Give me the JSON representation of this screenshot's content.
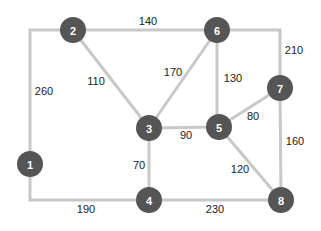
{
  "diagram": {
    "type": "weighted-graph",
    "colors": {
      "node_fill": "#555555",
      "node_text": "#ffffff",
      "edge": "#c8c8c8",
      "weight_text": "#222222"
    },
    "nodes": [
      {
        "id": "1",
        "label": "1",
        "x": 30,
        "y": 164
      },
      {
        "id": "2",
        "label": "2",
        "x": 73,
        "y": 30
      },
      {
        "id": "3",
        "label": "3",
        "x": 149,
        "y": 128
      },
      {
        "id": "4",
        "label": "4",
        "x": 149,
        "y": 200
      },
      {
        "id": "5",
        "label": "5",
        "x": 219,
        "y": 127
      },
      {
        "id": "6",
        "label": "6",
        "x": 217,
        "y": 30
      },
      {
        "id": "7",
        "label": "7",
        "x": 280,
        "y": 88
      },
      {
        "id": "8",
        "label": "8",
        "x": 281,
        "y": 200
      }
    ],
    "edges": [
      {
        "from": "2",
        "to": "1",
        "weight": "260",
        "path": "M73,30 L30,30 L30,164",
        "lx": 44,
        "ly": 91
      },
      {
        "from": "2",
        "to": "6",
        "weight": "140",
        "path": "M73,30 L217,30",
        "lx": 148,
        "ly": 21
      },
      {
        "from": "2",
        "to": "3",
        "weight": "110",
        "path": "M73,30 L149,128",
        "lx": 96,
        "ly": 81
      },
      {
        "from": "6",
        "to": "3",
        "weight": "170",
        "path": "M217,30 L149,128",
        "lx": 173,
        "ly": 72
      },
      {
        "from": "6",
        "to": "5",
        "weight": "130",
        "path": "M217,30 L217,127",
        "lx": 233,
        "ly": 78
      },
      {
        "from": "6",
        "to": "7",
        "weight": "210",
        "path": "M217,30 L280,30 L280,88",
        "lx": 294,
        "ly": 50
      },
      {
        "from": "3",
        "to": "5",
        "weight": "90",
        "path": "M149,128 L219,127",
        "lx": 186,
        "ly": 135
      },
      {
        "from": "3",
        "to": "4",
        "weight": "70",
        "path": "M149,128 L149,200",
        "lx": 139,
        "ly": 165
      },
      {
        "from": "5",
        "to": "7",
        "weight": "80",
        "path": "M219,127 L280,88",
        "lx": 253,
        "ly": 116
      },
      {
        "from": "5",
        "to": "8",
        "weight": "120",
        "path": "M219,127 L281,200",
        "lx": 240,
        "ly": 169
      },
      {
        "from": "7",
        "to": "8",
        "weight": "160",
        "path": "M280,88 L281,200",
        "lx": 295,
        "ly": 141
      },
      {
        "from": "1",
        "to": "4",
        "weight": "190",
        "path": "M30,164 L30,200 L149,200",
        "lx": 86,
        "ly": 209
      },
      {
        "from": "4",
        "to": "8",
        "weight": "230",
        "path": "M149,200 L281,200",
        "lx": 215,
        "ly": 209
      }
    ]
  }
}
